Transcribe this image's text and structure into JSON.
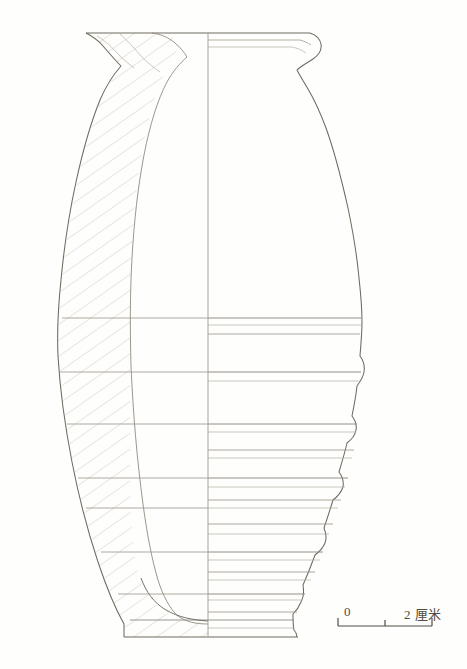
{
  "figure": {
    "kind": "archaeological-vessel-profile-drawing",
    "background_color": "#fefefd",
    "line_color": "#6f6a5f",
    "light_line_color": "#b6afa2",
    "hatch_color": "#cfc8bb",
    "text_color": "#514b42"
  },
  "scale_bar": {
    "zero_label": "0",
    "max_label": "2 厘米",
    "unit_name": "厘米",
    "max_value": 2,
    "tick_count": 3,
    "tick_values": [
      0,
      1,
      2
    ],
    "bar_left_x": 338,
    "bar_right_x": 432,
    "bar_y": 626
  },
  "vessel": {
    "center_axis_x": 208,
    "rim_top_y": 32,
    "base_bottom_y": 637,
    "max_width_left_x": 33,
    "max_width_right_x": 391,
    "max_width_y": 292,
    "rim_outer_left_x": 86,
    "rim_outer_right_x": 318,
    "base_left_x": 124,
    "base_right_x": 296,
    "left_half_note": "sectioned half with hatching",
    "right_half_note": "exterior profile with horizontal throwing ridges"
  },
  "decoration": {
    "description": "horizontal banded ridges on lower two thirds of body",
    "band_y_positions": [
      318,
      325,
      334,
      372,
      381,
      424,
      432,
      450,
      458,
      478,
      487,
      500,
      508,
      524,
      534,
      552,
      560,
      572,
      580,
      594,
      600,
      612,
      620,
      628
    ],
    "left_band_y_positions": [
      318,
      372,
      424,
      478,
      508,
      552,
      594,
      614
    ]
  }
}
